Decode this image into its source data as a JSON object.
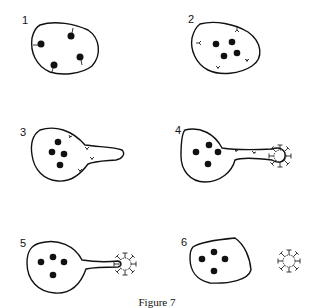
{
  "figure": {
    "caption": "Figure 7",
    "panels": [
      {
        "label": "1",
        "description": "Cell with four nuclei-like dots attached to membrane by tethers"
      },
      {
        "label": "2",
        "description": "Cell with four free dots; Y-shaped receptors on membrane"
      },
      {
        "label": "3",
        "description": "Cell extending a protrusion with receptors migrating toward it"
      },
      {
        "label": "4",
        "description": "Elongated protrusion contacting a virus particle"
      },
      {
        "label": "5",
        "description": "Virus particle at tip of long tube protrusion"
      },
      {
        "label": "6",
        "description": "Cell separated from free virus particle"
      }
    ]
  },
  "colors": {
    "stroke": "#111111",
    "background": "#ffffff"
  }
}
